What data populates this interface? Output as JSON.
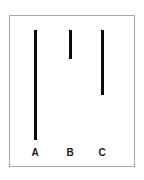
{
  "figure": {
    "background_color": "#ffffff",
    "frame_border_color": "#a9a9a9",
    "bar_color": "#0a0a0a",
    "label_color": "#1a1a1a"
  },
  "chart_data": {
    "type": "bar",
    "title": "",
    "subtitle": "",
    "xlabel": "",
    "ylabel": "",
    "categories": [
      "A",
      "B",
      "C"
    ],
    "values": [
      110,
      29,
      65
    ],
    "ylim": [
      0,
      124
    ],
    "grid": false,
    "legend": null,
    "orientation": "vertical-hanging",
    "bars": [
      {
        "label": "A",
        "value": 110,
        "color": "#0a0a0a"
      },
      {
        "label": "B",
        "value": 29,
        "color": "#0a0a0a"
      },
      {
        "label": "C",
        "value": 65,
        "color": "#0a0a0a"
      }
    ]
  },
  "labels": {
    "a": "A",
    "b": "B",
    "c": "C"
  }
}
